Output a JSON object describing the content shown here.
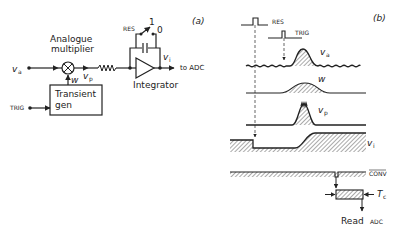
{
  "panel_a": {
    "tag": "(a)",
    "input_label": "v",
    "input_sub": "a",
    "multiplier_title_1": "Analogue",
    "multiplier_title_2": "multiplier",
    "weight_label": "w",
    "product_label": "v",
    "product_sub": "p",
    "res_label": "RES",
    "switch_1": "1",
    "switch_0": "0",
    "output_label": "v",
    "output_sub": "i",
    "to_adc": "to ADC",
    "integrator_label": "Integrator",
    "gen_label_1": "Transient",
    "gen_label_2": "gen",
    "trig_label": "TRIG"
  },
  "panel_b": {
    "tag": "(b)",
    "res_label": "RES",
    "trig_label": "TRIG",
    "va_label": "v",
    "va_sub": "a",
    "w_label": "w",
    "vp_label": "v",
    "vp_sub": "p",
    "vi_label": "v",
    "vi_sub": "i",
    "conv_label": "CONV",
    "tc_label": "T",
    "tc_sub": "c",
    "read_label": "Read",
    "adc_label": "ADC"
  },
  "colors": {
    "ink": "#222222",
    "hatch": "#555555",
    "background": "#ffffff"
  }
}
